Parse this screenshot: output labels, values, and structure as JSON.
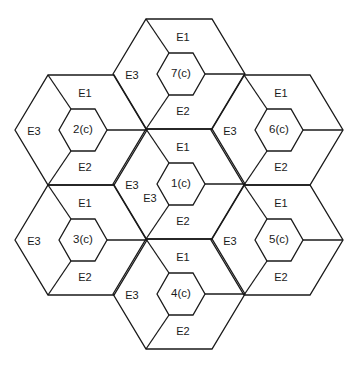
{
  "diagram": {
    "type": "hexagonal-cell-layout",
    "geometry": {
      "R": 66,
      "h": 55,
      "r": 24,
      "hh": 21
    },
    "cells": [
      {
        "id": "7(c)",
        "cx": 179,
        "cy": 74,
        "labels": {
          "e1": "E1",
          "e2": "E2",
          "e3": "E3"
        }
      },
      {
        "id": "2(c)",
        "cx": 81,
        "cy": 130,
        "labels": {
          "e1": "E1",
          "e2": "E2",
          "e3": "E3"
        }
      },
      {
        "id": "6(c)",
        "cx": 277,
        "cy": 130,
        "labels": {
          "e1": "E1",
          "e2": "E2",
          "e3": "E3"
        }
      },
      {
        "id": "1(c)",
        "cx": 179,
        "cy": 184,
        "labels": {
          "e1": "E1",
          "e2": "E2",
          "e3": "E3"
        },
        "extra_e3": "E3"
      },
      {
        "id": "3(c)",
        "cx": 81,
        "cy": 240,
        "labels": {
          "e1": "E1",
          "e2": "E2",
          "e3": "E3"
        }
      },
      {
        "id": "5(c)",
        "cx": 277,
        "cy": 240,
        "labels": {
          "e1": "E1",
          "e2": "E2",
          "e3": "E3"
        }
      },
      {
        "id": "4(c)",
        "cx": 179,
        "cy": 294,
        "labels": {
          "e1": "E1",
          "e2": "E2",
          "e3": "E3"
        }
      }
    ]
  }
}
